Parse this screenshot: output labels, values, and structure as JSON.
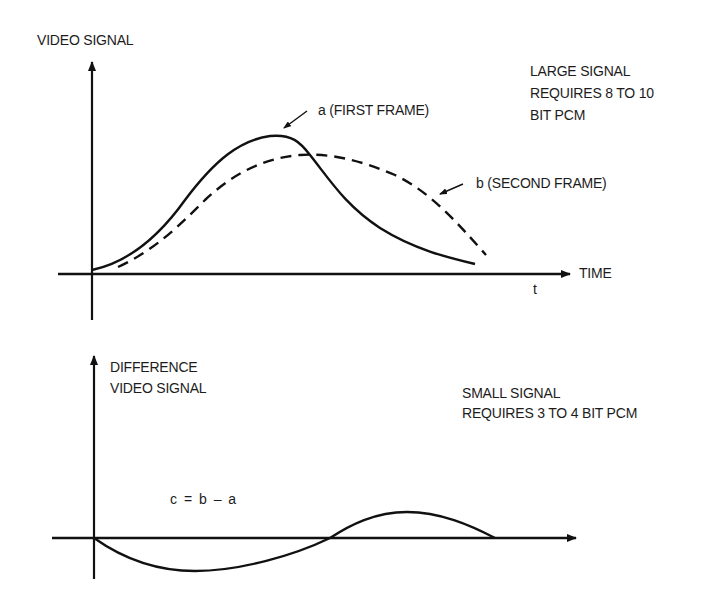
{
  "top_panel": {
    "y_axis_label": "VIDEO SIGNAL",
    "x_axis_label": "TIME",
    "x_axis_symbol": "t",
    "curve_a_label": "a (FIRST FRAME)",
    "curve_b_label": "b (SECOND FRAME)",
    "note_lines": [
      "LARGE SIGNAL",
      "REQUIRES 8 TO 10",
      "BIT PCM"
    ]
  },
  "bottom_panel": {
    "y_axis_label_lines": [
      "DIFFERENCE",
      "VIDEO SIGNAL"
    ],
    "equation": "c = b – a",
    "note_lines": [
      "SMALL SIGNAL",
      "REQUIRES 3 TO 4 BIT PCM"
    ]
  },
  "colors": {
    "ink": "#111111",
    "background": "#ffffff"
  }
}
